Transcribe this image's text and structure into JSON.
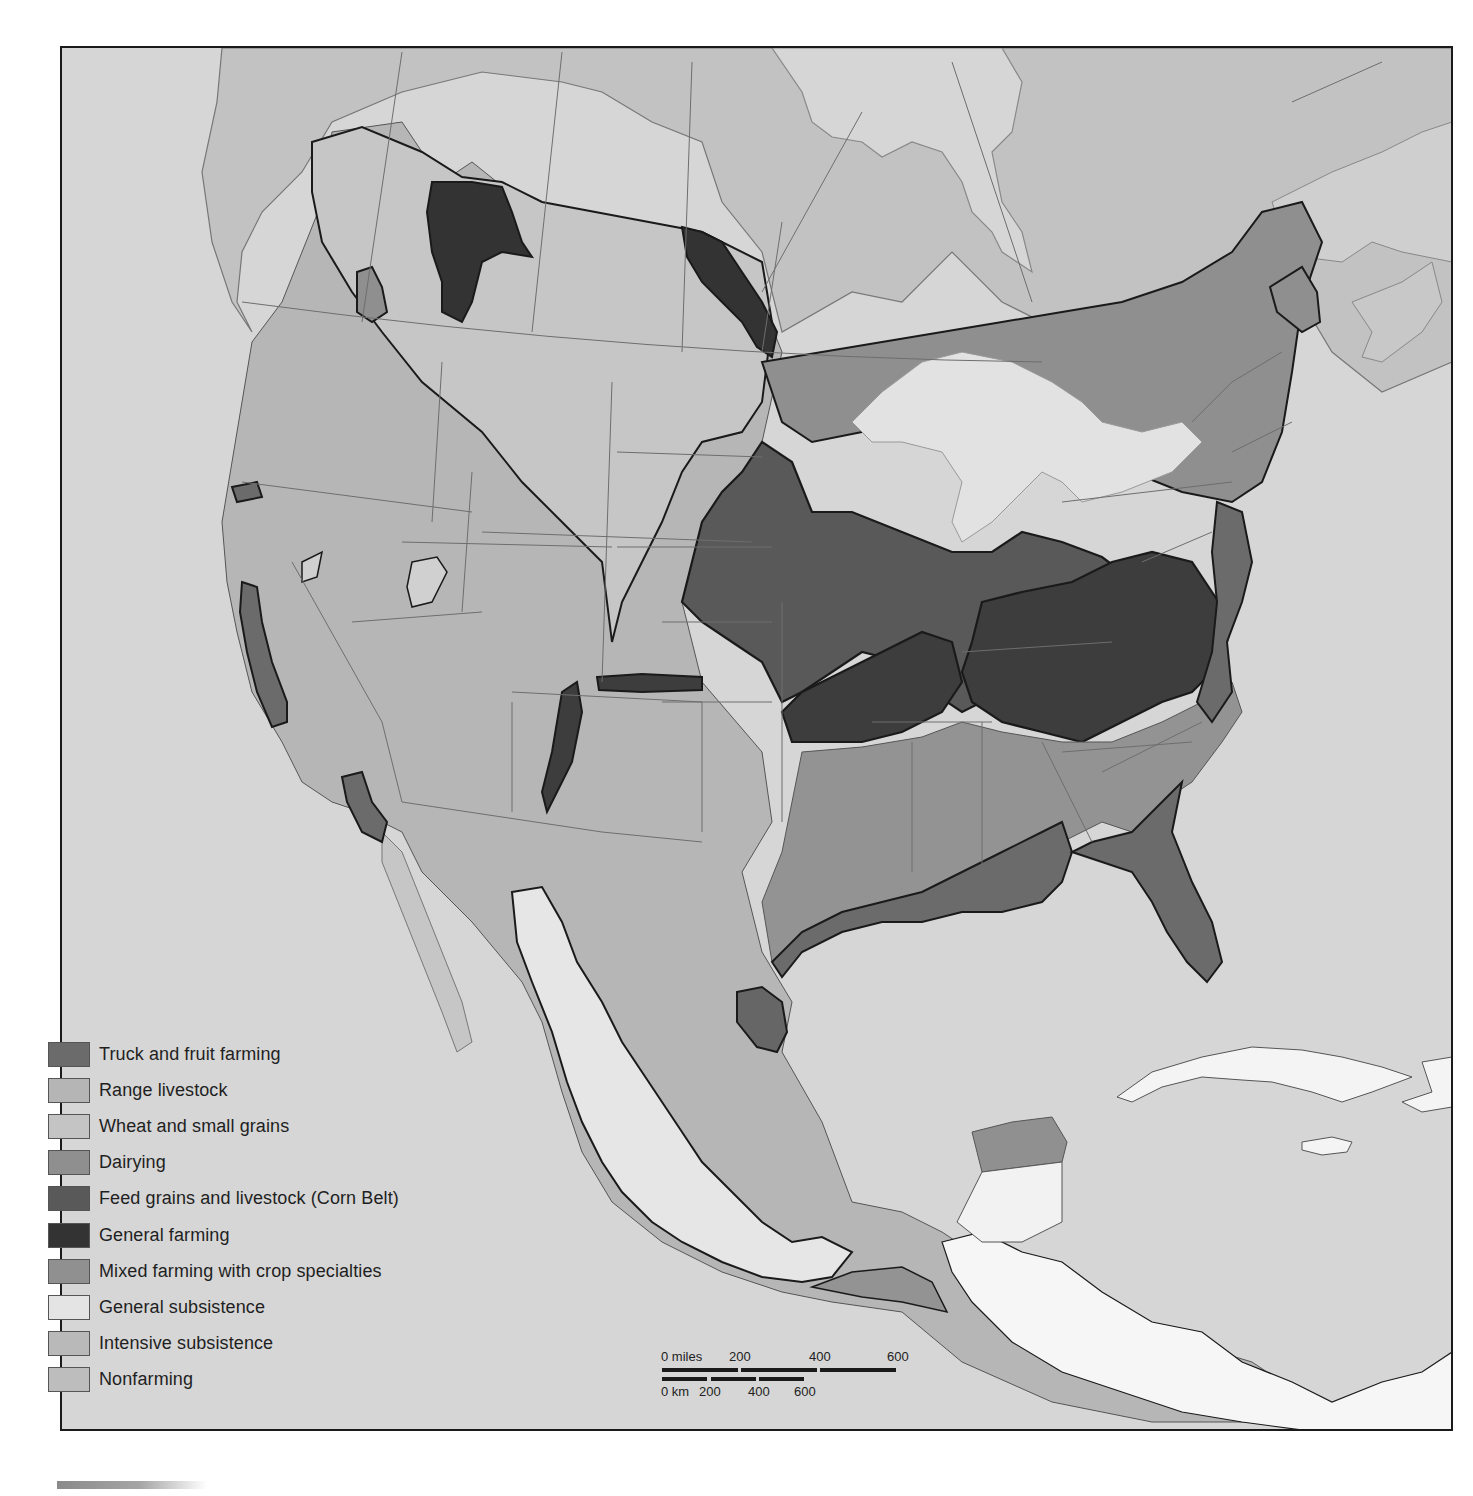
{
  "map": {
    "subject": "Agricultural regions of North America",
    "ocean_color": "#d6d6d6",
    "outline_color": "#1a1a1a",
    "border_color": "#6e6e6e"
  },
  "legend": {
    "items": [
      {
        "label": "Truck and fruit farming",
        "color": "#6b6b6b"
      },
      {
        "label": "Range livestock",
        "color": "#b5b5b5"
      },
      {
        "label": "Wheat and small grains",
        "color": "#c4c4c4"
      },
      {
        "label": "Dairying",
        "color": "#8f8f8f"
      },
      {
        "label": "Feed grains and livestock (Corn Belt)",
        "color": "#595959"
      },
      {
        "label": "General farming",
        "color": "#333333"
      },
      {
        "label": "Mixed farming with crop specialties",
        "color": "#909090"
      },
      {
        "label": "General subsistence",
        "color": "#e4e4e4"
      },
      {
        "label": "Intensive subsistence",
        "color": "#b9b9b9"
      },
      {
        "label": "Nonfarming",
        "color": "#bdbdbd"
      }
    ]
  },
  "scale_bar": {
    "miles_labels": [
      "0 miles",
      "200",
      "400",
      "600"
    ],
    "km_labels": [
      "0 km",
      "200",
      "400",
      "600"
    ]
  }
}
